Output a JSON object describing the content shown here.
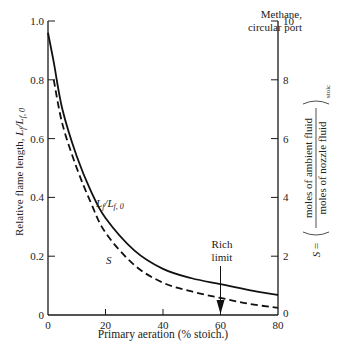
{
  "chart_data": {
    "type": "line",
    "title": "",
    "annotation_top_right": [
      "Methane,",
      "circular port"
    ],
    "xlabel": "Primary aeration (% stoich.)",
    "ylabel_left": "Relative flame length, Lf/Lf,0",
    "ylabel_right": "S = (moles of ambient fluid / moles of nozzle fluid)stoic",
    "ylabel_right_parts": {
      "prefix": "S =",
      "numerator": "moles of ambient fluid",
      "denominator": "moles of nozzle fluid",
      "subscript": "stoic"
    },
    "xlim": [
      0,
      80
    ],
    "ylim_left": [
      0,
      1.0
    ],
    "ylim_right": [
      0,
      10
    ],
    "x_ticks": [
      "0",
      "20",
      "40",
      "60",
      "80"
    ],
    "y_ticks_left": [
      "0",
      "0.2",
      "0.4",
      "0.6",
      "0.8",
      "1.0"
    ],
    "y_ticks_right": [
      "0",
      "2",
      "4",
      "6",
      "8",
      "10"
    ],
    "grid": false,
    "series": [
      {
        "name": "Lf/Lf,0",
        "label": "Lf/Lf, 0",
        "axis": "left",
        "style": "solid",
        "x": [
          0,
          2,
          5,
          10,
          15,
          20,
          30,
          40,
          50,
          60,
          70,
          80
        ],
        "y": [
          0.96,
          0.86,
          0.7,
          0.54,
          0.42,
          0.33,
          0.22,
          0.157,
          0.125,
          0.105,
          0.085,
          0.068
        ]
      },
      {
        "name": "S",
        "label": "S",
        "axis": "right",
        "style": "dashed",
        "x": [
          2,
          5,
          10,
          15,
          20,
          30,
          40,
          50,
          60,
          70,
          80
        ],
        "y": [
          8.0,
          6.5,
          5.0,
          3.8,
          2.8,
          1.7,
          1.1,
          0.8,
          0.58,
          0.38,
          0.24
        ]
      }
    ],
    "annotations": [
      {
        "text": [
          "Rich",
          "limit"
        ],
        "x": 60,
        "marker": "arrow-down"
      }
    ]
  }
}
